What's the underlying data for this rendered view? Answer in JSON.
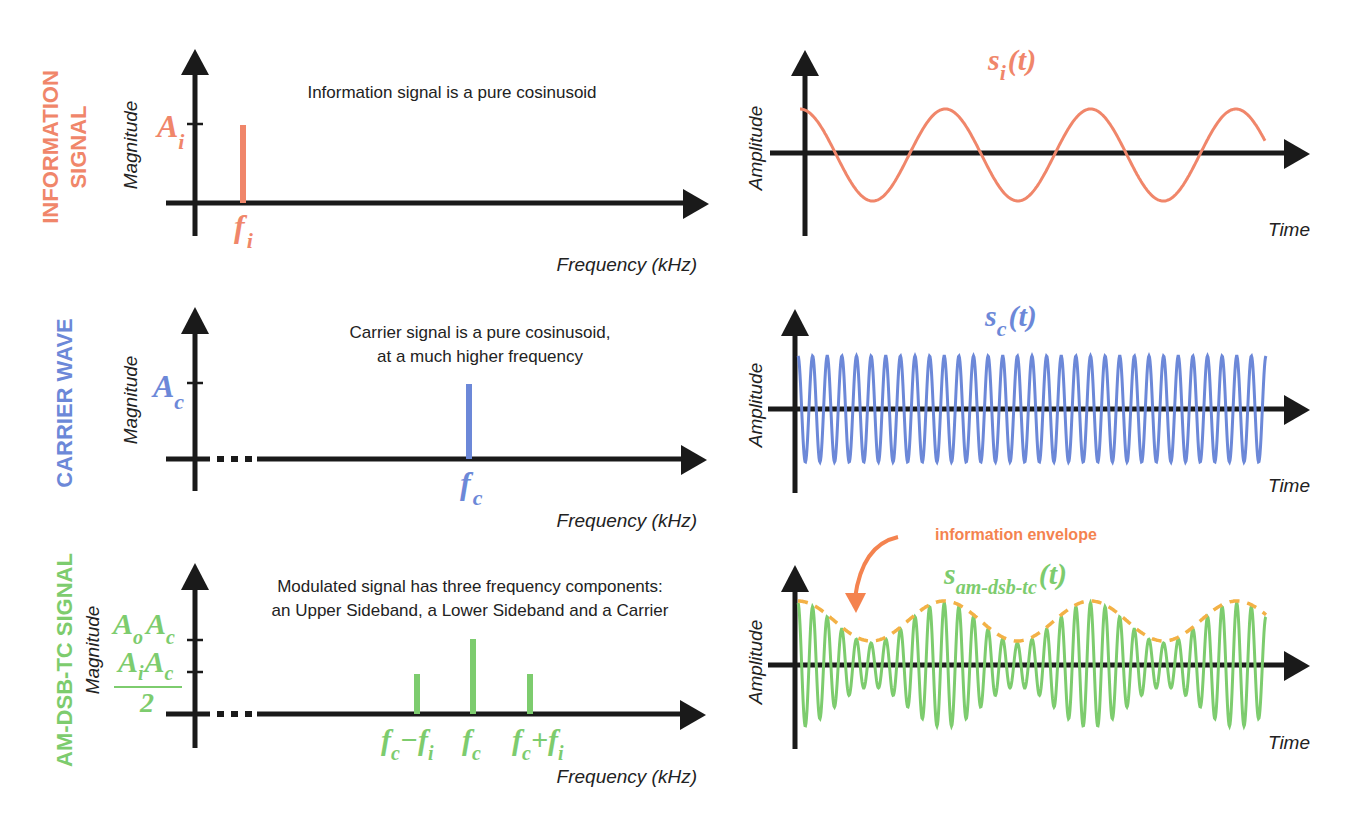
{
  "colors": {
    "info": "#f0866a",
    "carrier": "#6c88d8",
    "am": "#7dcc6e",
    "envelope": "#f3b146",
    "envelope_arrow": "#f4834f",
    "axis": "#1a1a1a",
    "text": "#222222"
  },
  "rows": [
    {
      "id": "information",
      "label_lines": [
        "INFORMATION",
        "SIGNAL"
      ],
      "color_key": "info",
      "spectrum": {
        "caption_lines": [
          "Information signal is a pure cosinusoid"
        ],
        "y_title": "Magnitude",
        "x_title": "Frequency (kHz)",
        "broken_axis": false,
        "ticks": [
          {
            "label_main": "A",
            "label_sub": "i"
          }
        ],
        "spikes": [
          {
            "label_main": "f",
            "label_sub": "i"
          }
        ]
      },
      "time": {
        "y_title": "Amplitude",
        "x_title": "Time",
        "signal_main": "s",
        "signal_sub": "i",
        "signal_suffix": "(t)"
      }
    },
    {
      "id": "carrier",
      "label_lines": [
        "CARRIER WAVE"
      ],
      "color_key": "carrier",
      "spectrum": {
        "caption_lines": [
          "Carrier signal is a pure cosinusoid,",
          "at a much higher frequency"
        ],
        "y_title": "Magnitude",
        "x_title": "Frequency (kHz)",
        "broken_axis": true,
        "ticks": [
          {
            "label_main": "A",
            "label_sub": "c"
          }
        ],
        "spikes": [
          {
            "label_main": "f",
            "label_sub": "c"
          }
        ]
      },
      "time": {
        "y_title": "Amplitude",
        "x_title": "Time",
        "signal_main": "s",
        "signal_sub": "c",
        "signal_suffix": "(t)"
      }
    },
    {
      "id": "am-dsb-tc",
      "label_lines": [
        "AM-DSB-TC SIGNAL"
      ],
      "color_key": "am",
      "spectrum": {
        "caption_lines": [
          "Modulated signal has three frequency components:",
          "an Upper Sideband, a Lower Sideband and a Carrier"
        ],
        "y_title": "Magnitude",
        "x_title": "Frequency (kHz)",
        "broken_axis": true,
        "ticks": [
          {
            "label": "A_o A_c",
            "parts": [
              "A",
              "o",
              "A",
              "c"
            ]
          },
          {
            "label": "A_i A_c / 2",
            "parts": [
              "A",
              "i",
              "A",
              "c"
            ],
            "denominator": "2"
          }
        ],
        "spikes": [
          {
            "label": "f_c - f_i",
            "parts": [
              "f",
              "c",
              "−f",
              "i"
            ]
          },
          {
            "label": "f_c",
            "parts": [
              "f",
              "c"
            ]
          },
          {
            "label": "f_c + f_i",
            "parts": [
              "f",
              "c",
              "+f",
              "i"
            ]
          }
        ]
      },
      "time": {
        "y_title": "Amplitude",
        "x_title": "Time",
        "signal_main": "s",
        "signal_sub": "am-dsb-tc",
        "signal_suffix": "(t)",
        "annotation": "information envelope"
      }
    }
  ],
  "chart_data": [
    {
      "type": "bar",
      "title": "Information signal spectrum",
      "xlabel": "Frequency (kHz)",
      "ylabel": "Magnitude",
      "categories": [
        "f_i"
      ],
      "values": [
        1.0
      ],
      "ytick_labels": [
        "A_i"
      ]
    },
    {
      "type": "line",
      "title": "s_i(t)",
      "xlabel": "Time",
      "ylabel": "Amplitude",
      "function": "cosine",
      "cycles": 3.2,
      "amplitude": 1.0
    },
    {
      "type": "bar",
      "title": "Carrier wave spectrum",
      "xlabel": "Frequency (kHz)",
      "ylabel": "Magnitude",
      "categories": [
        "f_c"
      ],
      "values": [
        1.0
      ],
      "ytick_labels": [
        "A_c"
      ]
    },
    {
      "type": "line",
      "title": "s_c(t)",
      "xlabel": "Time",
      "ylabel": "Amplitude",
      "function": "cosine",
      "cycles": 32,
      "amplitude": 1.0
    },
    {
      "type": "bar",
      "title": "AM-DSB-TC spectrum",
      "xlabel": "Frequency (kHz)",
      "ylabel": "Magnitude",
      "categories": [
        "f_c - f_i",
        "f_c",
        "f_c + f_i"
      ],
      "values": [
        0.55,
        1.0,
        0.55
      ],
      "ytick_labels": [
        "A_o A_c",
        "A_i A_c / 2"
      ]
    },
    {
      "type": "line",
      "title": "s_am-dsb-tc(t)",
      "xlabel": "Time",
      "ylabel": "Amplitude",
      "function": "(A_o + A_i cos(2π f_i t)) cos(2π f_c t)",
      "carrier_cycles": 32,
      "envelope_cycles": 3.2,
      "envelope_max": 1.0,
      "envelope_min": 0.38,
      "annotation": "information envelope"
    }
  ]
}
